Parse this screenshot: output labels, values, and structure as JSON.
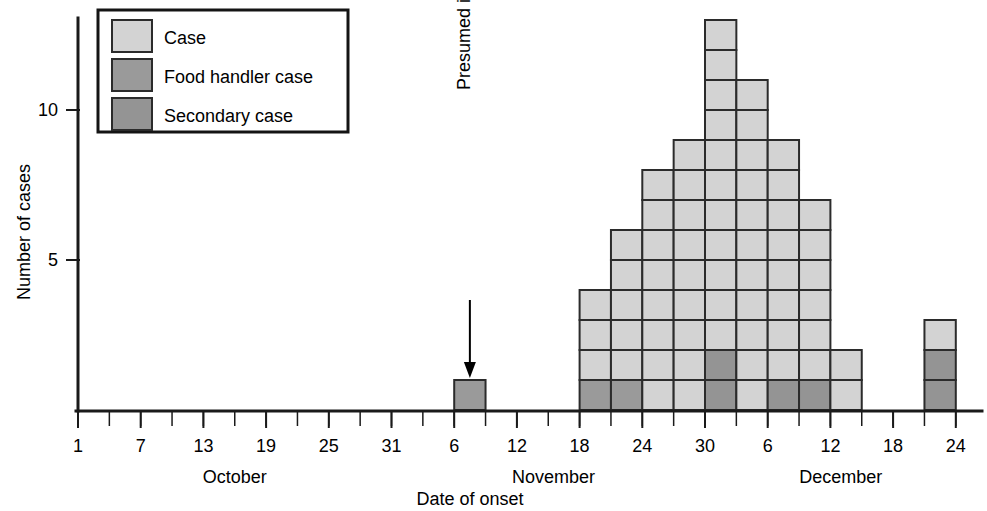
{
  "chart_data": {
    "type": "bar",
    "title": "",
    "subtitle": "",
    "xlabel": "Date of onset",
    "ylabel": "Number of cases",
    "stacked": true,
    "grid": false,
    "legend_position": "top-left",
    "ylim": [
      0,
      13.6
    ],
    "yticks": [
      5,
      10
    ],
    "ytick_labels": [
      "5",
      "10"
    ],
    "xlim_days": [
      1,
      86
    ],
    "x_tick_interval_days": 3,
    "x_label_interval_days": 6,
    "months": [
      {
        "name": "October",
        "label": "October",
        "start_day": 1,
        "end_day": 31,
        "tick_labels": [
          "1",
          "7",
          "13",
          "19",
          "25",
          "31"
        ]
      },
      {
        "name": "November",
        "label": "November",
        "start_day": 32,
        "end_day": 61,
        "tick_labels": [
          "6",
          "12",
          "18",
          "24",
          "30"
        ]
      },
      {
        "name": "December",
        "label": "December",
        "start_day": 62,
        "end_day": 86,
        "tick_labels": [
          "6",
          "12",
          "18",
          "24"
        ]
      }
    ],
    "series": [
      {
        "name": "Case",
        "key": "case",
        "color": "#d3d3d3"
      },
      {
        "name": "Food handler case",
        "key": "food_handler",
        "color": "#9a9a9a"
      },
      {
        "name": "Secondary case",
        "key": "secondary",
        "color": "#949494"
      }
    ],
    "categories": [
      "Nov 6",
      "Nov 18",
      "Nov 21",
      "Nov 24",
      "Nov 27",
      "Nov 30",
      "Dec 3",
      "Dec 6",
      "Dec 9",
      "Dec 12",
      "Dec 21"
    ],
    "bars": [
      {
        "label": "Nov 6",
        "start_day": 37,
        "total": 1,
        "stack": [
          "food_handler"
        ]
      },
      {
        "label": "Nov 18",
        "start_day": 49,
        "total": 4,
        "stack": [
          "food_handler",
          "case",
          "case",
          "case"
        ]
      },
      {
        "label": "Nov 21",
        "start_day": 52,
        "total": 6,
        "stack": [
          "food_handler",
          "case",
          "case",
          "case",
          "case",
          "case"
        ]
      },
      {
        "label": "Nov 24",
        "start_day": 55,
        "total": 8,
        "stack": [
          "case",
          "case",
          "case",
          "case",
          "case",
          "case",
          "case",
          "case"
        ]
      },
      {
        "label": "Nov 27",
        "start_day": 58,
        "total": 9,
        "stack": [
          "case",
          "case",
          "case",
          "case",
          "case",
          "case",
          "case",
          "case",
          "case"
        ]
      },
      {
        "label": "Nov 30",
        "start_day": 61,
        "total": 13,
        "stack": [
          "secondary",
          "secondary",
          "case",
          "case",
          "case",
          "case",
          "case",
          "case",
          "case",
          "case",
          "case",
          "case",
          "case"
        ]
      },
      {
        "label": "Dec 3",
        "start_day": 64,
        "total": 11,
        "stack": [
          "case",
          "case",
          "case",
          "case",
          "case",
          "case",
          "case",
          "case",
          "case",
          "case",
          "case"
        ]
      },
      {
        "label": "Dec 6",
        "start_day": 67,
        "total": 9,
        "stack": [
          "secondary",
          "case",
          "case",
          "case",
          "case",
          "case",
          "case",
          "case",
          "case"
        ]
      },
      {
        "label": "Dec 9",
        "start_day": 70,
        "total": 7,
        "stack": [
          "secondary",
          "case",
          "case",
          "case",
          "case",
          "case",
          "case"
        ]
      },
      {
        "label": "Dec 12",
        "start_day": 73,
        "total": 2,
        "stack": [
          "case",
          "case"
        ]
      },
      {
        "label": "Dec 21",
        "start_day": 82,
        "total": 3,
        "stack": [
          "secondary",
          "secondary",
          "case"
        ]
      }
    ]
  },
  "legend": {
    "items": [
      {
        "label": "Case",
        "color": "#d3d3d3"
      },
      {
        "label": "Food handler case",
        "color": "#9a9a9a"
      },
      {
        "label": "Secondary case",
        "color": "#949494"
      }
    ]
  },
  "annotations": [
    {
      "id": "presumed-index-case",
      "text": "Presumed index case",
      "target_day": 37
    }
  ],
  "axes": {
    "y_title": "Number of cases",
    "x_title": "Date of onset"
  },
  "colors": {
    "case": "#d3d3d3",
    "food_handler": "#9a9a9a",
    "secondary": "#949494",
    "outline": "#2b2b2b",
    "axis": "#1a1a1a",
    "background": "#ffffff"
  }
}
